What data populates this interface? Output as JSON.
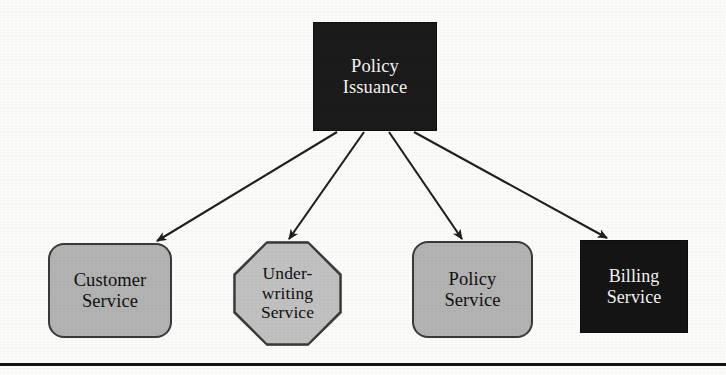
{
  "diagram": {
    "type": "directed-graph",
    "colors": {
      "dark_fill": "#1b1b1b",
      "dark_text": "#f4f4f2",
      "gray_fill": "#b4b4b4",
      "octagon_fill": "#c2c2c2",
      "outline": "#3a3a3a",
      "edge": "#1f1f1f",
      "background": "#fdfdfc"
    },
    "root": {
      "id": "policy-issuance",
      "label": "Policy\nIssuance",
      "shape": "rectangle",
      "fill": "dark"
    },
    "nodes": [
      {
        "id": "customer-service",
        "label": "Customer\nService",
        "shape": "rounded-rectangle",
        "fill": "gray"
      },
      {
        "id": "underwriting-service",
        "label": "Under-\nwriting\nService",
        "shape": "octagon",
        "fill": "gray"
      },
      {
        "id": "policy-service",
        "label": "Policy\nService",
        "shape": "rounded-rectangle",
        "fill": "gray"
      },
      {
        "id": "billing-service",
        "label": "Billing\nService",
        "shape": "rectangle",
        "fill": "dark"
      }
    ],
    "edges": [
      {
        "from": "policy-issuance",
        "to": "customer-service",
        "style": "solid",
        "arrow": "single"
      },
      {
        "from": "policy-issuance",
        "to": "underwriting-service",
        "style": "solid",
        "arrow": "single"
      },
      {
        "from": "policy-issuance",
        "to": "policy-service",
        "style": "solid",
        "arrow": "single"
      },
      {
        "from": "policy-issuance",
        "to": "billing-service",
        "style": "solid",
        "arrow": "single"
      }
    ],
    "divider": {
      "present": true,
      "orientation": "horizontal"
    }
  }
}
